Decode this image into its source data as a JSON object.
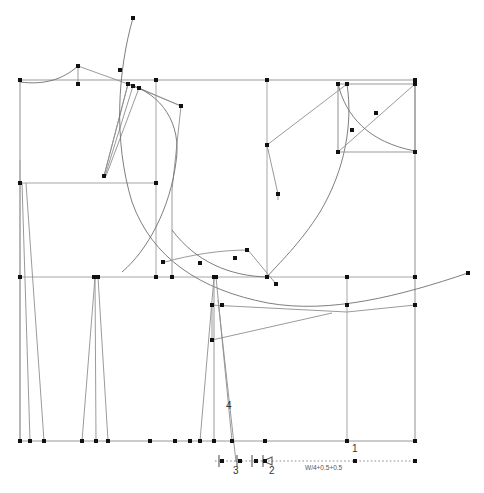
{
  "document": {
    "type": "sewing-pattern-draft",
    "title": "Bodice block pattern draft",
    "background_color": "#ffffff",
    "line_color": "#8f8f8f",
    "point_color": "#111111",
    "dimension_color": "#808080"
  },
  "labels": [
    {
      "id": "label-1",
      "text": "1",
      "x": 355,
      "y": 449
    },
    {
      "id": "label-2",
      "text": "2",
      "x": 272,
      "y": 470
    },
    {
      "id": "label-3",
      "text": "3",
      "x": 236,
      "y": 470
    },
    {
      "id": "label-4",
      "text": "4",
      "x": 228,
      "y": 406
    }
  ],
  "dimension": {
    "formula": "W/4+0.5+0.5",
    "x": 337,
    "y": 467,
    "line_y": 461,
    "line_start_x": 215,
    "line_end_x": 415
  },
  "frame": {
    "left": 20,
    "right": 415,
    "top": 80,
    "bottom": 441,
    "guides_y": [
      183,
      277
    ],
    "guides_x": [
      156,
      267,
      347
    ]
  },
  "chart_data": {
    "type": "line",
    "xlabel": "",
    "ylabel": "",
    "xlim": [
      0,
      484
    ],
    "ylim": [
      0,
      493
    ],
    "grid": false,
    "legend": "none",
    "annotations": [
      "1",
      "2",
      "3",
      "4",
      "W/4+0.5+0.5"
    ],
    "series": [
      {
        "name": "frame-rectangle",
        "kind": "polyline",
        "points": [
          [
            20,
            80
          ],
          [
            415,
            80
          ],
          [
            415,
            441
          ],
          [
            20,
            441
          ],
          [
            20,
            80
          ]
        ]
      },
      {
        "name": "horizontal-guide-bust",
        "kind": "polyline",
        "points": [
          [
            20,
            183
          ],
          [
            156,
            183
          ]
        ]
      },
      {
        "name": "horizontal-guide-waist",
        "kind": "polyline",
        "points": [
          [
            20,
            277
          ],
          [
            415,
            277
          ]
        ]
      },
      {
        "name": "vertical-guide-center",
        "kind": "polyline",
        "points": [
          [
            156,
            80
          ],
          [
            156,
            277
          ]
        ]
      },
      {
        "name": "vertical-guide-side",
        "kind": "polyline",
        "points": [
          [
            267,
            80
          ],
          [
            267,
            277
          ]
        ]
      },
      {
        "name": "vertical-guide-right",
        "kind": "polyline",
        "points": [
          [
            347,
            277
          ],
          [
            347,
            441
          ]
        ]
      },
      {
        "name": "neckline-curve-left",
        "kind": "curve",
        "points": [
          [
            20,
            82
          ],
          [
            52,
            84
          ],
          [
            68,
            72
          ],
          [
            78,
            66
          ]
        ]
      },
      {
        "name": "shoulder-line-left",
        "kind": "polyline",
        "points": [
          [
            78,
            66
          ],
          [
            128,
            84
          ]
        ]
      },
      {
        "name": "neck-drop-left",
        "kind": "polyline",
        "points": [
          [
            78,
            66
          ],
          [
            78,
            84
          ]
        ]
      },
      {
        "name": "shoulder-dart-fan",
        "kind": "multiline",
        "segments": [
          [
            [
              128,
              84
            ],
            [
              104,
              176
            ]
          ],
          [
            [
              133,
              86
            ],
            [
              104,
              176
            ]
          ],
          [
            [
              139,
              88
            ],
            [
              104,
              176
            ]
          ],
          [
            [
              128,
              84
            ],
            [
              181,
              106
            ]
          ],
          [
            [
              139,
              88
            ],
            [
              181,
              106
            ]
          ]
        ]
      },
      {
        "name": "armhole-curve-front",
        "kind": "curve",
        "points": [
          [
            128,
            84
          ],
          [
            163,
            92
          ],
          [
            181,
            120
          ],
          [
            176,
            160
          ],
          [
            160,
            210
          ],
          [
            140,
            250
          ],
          [
            120,
            270
          ]
        ]
      },
      {
        "name": "long-sweep-curve",
        "kind": "curve",
        "points": [
          [
            133,
            18
          ],
          [
            120,
            70
          ],
          [
            116,
            130
          ],
          [
            130,
            200
          ],
          [
            165,
            250
          ],
          [
            215,
            277
          ],
          [
            300,
            305
          ],
          [
            380,
            300
          ],
          [
            468,
            273
          ]
        ]
      },
      {
        "name": "shoulder-line-right",
        "kind": "polyline",
        "points": [
          [
            267,
            145
          ],
          [
            347,
            84
          ]
        ]
      },
      {
        "name": "neck-right",
        "kind": "polyline",
        "points": [
          [
            267,
            145
          ],
          [
            278,
            194
          ]
        ]
      },
      {
        "name": "armhole-curve-back",
        "kind": "curve",
        "points": [
          [
            347,
            84
          ],
          [
            352,
            120
          ],
          [
            348,
            160
          ],
          [
            330,
            200
          ],
          [
            300,
            240
          ],
          [
            275,
            262
          ],
          [
            267,
            277
          ]
        ]
      },
      {
        "name": "sleeve-box",
        "kind": "polyline",
        "points": [
          [
            338,
            84
          ],
          [
            415,
            84
          ],
          [
            415,
            152
          ],
          [
            338,
            152
          ],
          [
            338,
            84
          ]
        ]
      },
      {
        "name": "sleeve-box-diagonal",
        "kind": "polyline",
        "points": [
          [
            338,
            152
          ],
          [
            415,
            84
          ]
        ]
      },
      {
        "name": "sleeve-cap-curve",
        "kind": "curve",
        "points": [
          [
            338,
            84
          ],
          [
            352,
            118
          ],
          [
            372,
            140
          ],
          [
            415,
            151
          ]
        ]
      },
      {
        "name": "waist-dart-left-1",
        "kind": "polyline",
        "points": [
          [
            22,
            183
          ],
          [
            30,
            441
          ],
          [
            44,
            441
          ],
          [
            26,
            183
          ]
        ]
      },
      {
        "name": "waist-dart-left-2",
        "kind": "polyline",
        "points": [
          [
            94,
            277
          ],
          [
            82,
            441
          ],
          [
            96,
            441
          ],
          [
            98,
            277
          ],
          [
            108,
            441
          ],
          [
            96,
            441
          ]
        ]
      },
      {
        "name": "waist-dart-center",
        "kind": "polyline",
        "points": [
          [
            214,
            277
          ],
          [
            200,
            441
          ],
          [
            214,
            441
          ],
          [
            216,
            277
          ],
          [
            232,
            441
          ],
          [
            214,
            441
          ]
        ]
      },
      {
        "name": "dart-leg-extension",
        "kind": "polyline",
        "points": [
          [
            220,
            330
          ],
          [
            236,
            460
          ]
        ]
      },
      {
        "name": "hip-line-right",
        "kind": "polyline",
        "points": [
          [
            210,
            305
          ],
          [
            347,
            313
          ],
          [
            415,
            305
          ]
        ]
      },
      {
        "name": "hip-line-low",
        "kind": "polyline",
        "points": [
          [
            212,
            340
          ],
          [
            330,
            314
          ]
        ]
      },
      {
        "name": "inner-box-lower",
        "kind": "polyline",
        "points": [
          [
            172,
            268
          ],
          [
            172,
            277
          ]
        ]
      },
      {
        "name": "bottom-dim-line",
        "kind": "polyline",
        "points": [
          [
            215,
            461
          ],
          [
            415,
            461
          ]
        ]
      }
    ],
    "points": [
      [
        20,
        80
      ],
      [
        78,
        66
      ],
      [
        78,
        84
      ],
      [
        128,
        84
      ],
      [
        133,
        86
      ],
      [
        139,
        88
      ],
      [
        156,
        80
      ],
      [
        181,
        106
      ],
      [
        267,
        80
      ],
      [
        267,
        145
      ],
      [
        278,
        194
      ],
      [
        338,
        84
      ],
      [
        347,
        84
      ],
      [
        415,
        80
      ],
      [
        415,
        84
      ],
      [
        338,
        152
      ],
      [
        415,
        152
      ],
      [
        376,
        113
      ],
      [
        352,
        130
      ],
      [
        104,
        176
      ],
      [
        20,
        183
      ],
      [
        156,
        183
      ],
      [
        133,
        18
      ],
      [
        120,
        70
      ],
      [
        20,
        277
      ],
      [
        94,
        277
      ],
      [
        98,
        277
      ],
      [
        156,
        277
      ],
      [
        172,
        277
      ],
      [
        214,
        277
      ],
      [
        216,
        277
      ],
      [
        267,
        277
      ],
      [
        347,
        277
      ],
      [
        415,
        277
      ],
      [
        276,
        284
      ],
      [
        247,
        250
      ],
      [
        200,
        263
      ],
      [
        235,
        258
      ],
      [
        163,
        262
      ],
      [
        212,
        305
      ],
      [
        222,
        305
      ],
      [
        347,
        305
      ],
      [
        415,
        305
      ],
      [
        212,
        340
      ],
      [
        468,
        273
      ],
      [
        20,
        441
      ],
      [
        30,
        441
      ],
      [
        44,
        441
      ],
      [
        82,
        441
      ],
      [
        96,
        441
      ],
      [
        108,
        441
      ],
      [
        150,
        441
      ],
      [
        175,
        441
      ],
      [
        190,
        441
      ],
      [
        200,
        441
      ],
      [
        214,
        441
      ],
      [
        232,
        441
      ],
      [
        265,
        441
      ],
      [
        347,
        441
      ],
      [
        415,
        441
      ],
      [
        222,
        461
      ],
      [
        240,
        461
      ],
      [
        256,
        461
      ],
      [
        265,
        461
      ],
      [
        355,
        461
      ],
      [
        415,
        461
      ]
    ]
  }
}
